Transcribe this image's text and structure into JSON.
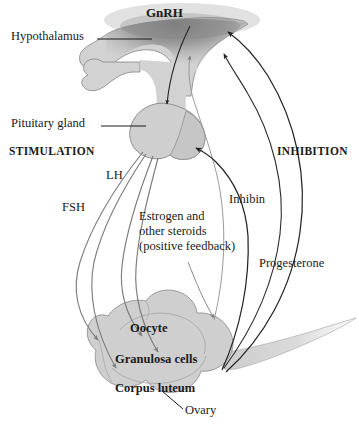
{
  "figure": {
    "background_color": "#ffffff",
    "organ_fill_color": "#cfcfcf",
    "organ_stroke_color": "#8f8f8f",
    "hypothalamus_shade_color": "#8a8a8a",
    "stimulation_arrow_color": "#7c7c7c",
    "inhibition_arrow_color": "#242424",
    "leader_line_color": "#1a1a1a",
    "text_color": "#1a1a1a"
  },
  "labels": {
    "gnrh": "GnRH",
    "hypothalamus": "Hypothalamus",
    "pituitary_gland": "Pituitary gland",
    "stimulation": "STIMULATION",
    "inhibition": "INHIBITION",
    "lh": "LH",
    "fsh": "FSH",
    "estrogen_line1": "Estrogen and",
    "estrogen_line2": "other steroids",
    "estrogen_line3": "(positive feedback)",
    "inhibin": "Inhibin",
    "progesterone": "Progesterone",
    "oocyte": "Oocyte",
    "granulosa_cells": "Granulosa cells",
    "corpus_luteum": "Corpus luteum",
    "ovary": "Ovary"
  },
  "structures": [
    {
      "name": "hypothalamus",
      "label": "Hypothalamus",
      "label_style": "regular"
    },
    {
      "name": "pituitary-gland",
      "label": "Pituitary gland",
      "label_style": "regular"
    },
    {
      "name": "ovary",
      "label": "Ovary",
      "label_style": "regular"
    },
    {
      "name": "oocyte",
      "label": "Oocyte",
      "label_style": "bold"
    },
    {
      "name": "granulosa-cells",
      "label": "Granulosa cells",
      "label_style": "bold"
    },
    {
      "name": "corpus-luteum",
      "label": "Corpus luteum",
      "label_style": "bold"
    }
  ],
  "pathways": {
    "stimulation_heading": "STIMULATION",
    "inhibition_heading": "INHIBITION",
    "stimulatory": [
      {
        "name": "gnrh",
        "label": "GnRH",
        "from": "hypothalamus",
        "to": "pituitary-gland"
      },
      {
        "name": "lh",
        "label": "LH",
        "from": "pituitary-gland",
        "to": "ovary"
      },
      {
        "name": "fsh",
        "label": "FSH",
        "from": "pituitary-gland",
        "to": "ovary"
      },
      {
        "name": "estrogen-positive-feedback",
        "label": "Estrogen and other steroids (positive feedback)",
        "from": "ovary",
        "to": "pituitary-gland"
      }
    ],
    "inhibitory": [
      {
        "name": "inhibin",
        "label": "Inhibin",
        "from": "ovary",
        "to": "pituitary-gland"
      },
      {
        "name": "progesterone",
        "label": "Progesterone",
        "from": "ovary",
        "to": "hypothalamus"
      },
      {
        "name": "estrogen-negative-feedback",
        "label": "Estrogen",
        "from": "ovary",
        "to": "hypothalamus"
      }
    ]
  }
}
